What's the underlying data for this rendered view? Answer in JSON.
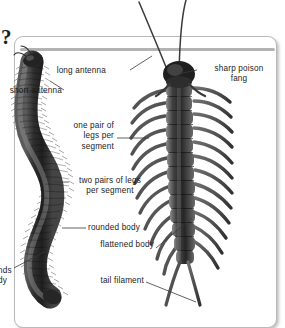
{
  "figure": {
    "title_marker": "?",
    "background_color": "#ffffff",
    "panel_color": "#ffffff",
    "panel_border_color": "#b9b9b9",
    "rule_color": "#b3b3b3",
    "text_color": "#1b1b1b",
    "line_color": "#333333",
    "art_color_dark": "#2b2b2b",
    "art_color_mid": "#6e6e6e",
    "art_color_light": "#a8a8a8"
  },
  "organisms": {
    "left": {
      "name": "millipede",
      "pose": "curved S-shaped body, many short legs",
      "traits": [
        "rounded body",
        "two pairs of legs per segment",
        "short antenna"
      ]
    },
    "right": {
      "name": "centipede",
      "pose": "straight vertical body, long splayed legs",
      "traits": [
        "flattened body",
        "one pair of legs per segment",
        "long antenna",
        "sharp poison fang",
        "tail filament"
      ]
    }
  },
  "labels": [
    {
      "id": "long-antenna",
      "text": "long antenna",
      "align": "right"
    },
    {
      "id": "short-antenna",
      "text": "short antenna",
      "align": "right"
    },
    {
      "id": "sharp-poison-fang",
      "text": "sharp poison\nfang",
      "align": "center"
    },
    {
      "id": "one-pair-of-legs",
      "text": "one pair of\nlegs per\nsegment",
      "align": "right"
    },
    {
      "id": "two-pairs-of-legs",
      "text": "two pairs of legs\nper segment",
      "align": "left"
    },
    {
      "id": "rounded-body",
      "text": "rounded body",
      "align": "left"
    },
    {
      "id": "flattened-body",
      "text": "flattened body",
      "align": "right"
    },
    {
      "id": "tail-filament",
      "text": "tail filament",
      "align": "right"
    },
    {
      "id": "clipped-left-lower",
      "text": "nds\ndy",
      "align": "left"
    }
  ]
}
